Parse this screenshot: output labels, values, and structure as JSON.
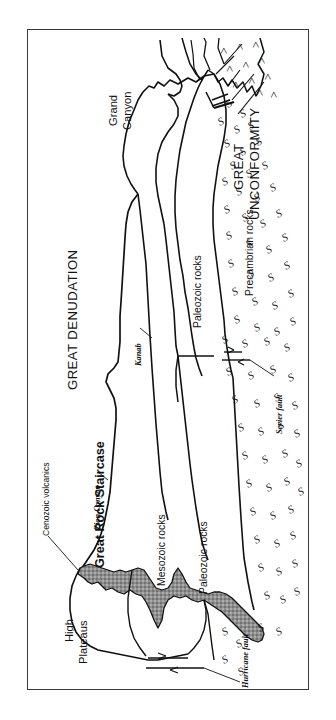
{
  "figure": {
    "type": "geologic-cross-section",
    "title_region_left": "GREAT DENUDATION",
    "title_region_right_line1": "GREAT",
    "title_region_right_line2": "UNCONFORMITY",
    "orientation_note": "diagram drawn rotated 90 degrees (reads bottom-to-top)",
    "frame_color": "#3a3a3a",
    "background_color": "#ffffff",
    "volcanic_fill_color": "#9a9a9a",
    "line_color": "#111111"
  },
  "headings": [
    {
      "id": "great-denudation",
      "text": "GREAT DENUDATION"
    },
    {
      "id": "great-unconformity-l1",
      "text": "GREAT"
    },
    {
      "id": "great-unconformity-l2",
      "text": "UNCONFORMITY"
    },
    {
      "id": "great-rock-staircase",
      "text": "Great Rock Staircase"
    }
  ],
  "place_labels": [
    {
      "id": "high-plateaus-l1",
      "text": "High"
    },
    {
      "id": "high-plateaus-l2",
      "text": "Plateaus"
    },
    {
      "id": "grand-canyon-l1",
      "text": "Grand"
    },
    {
      "id": "grand-canyon-l2",
      "text": "Canyon"
    }
  ],
  "unit_labels": [
    {
      "id": "cenozoic-volcanics",
      "text": "Cenozoic volcanics"
    },
    {
      "id": "mesozoic-rocks",
      "text": "Mesozoic rocks"
    },
    {
      "id": "paleozoic-rocks-west",
      "text": "Paleozoic rocks"
    },
    {
      "id": "paleozoic-rocks-east",
      "text": "Paleozoic rocks"
    },
    {
      "id": "precambrian-rocks",
      "text": "Precambrian rocks"
    }
  ],
  "feature_labels": [
    {
      "id": "zion-canyon",
      "text": "Zion Canyon"
    },
    {
      "id": "kanab",
      "text": "Kanab"
    },
    {
      "id": "hurricane-fault",
      "text": "Hurricane fault"
    },
    {
      "id": "sevier-fault",
      "text": "Sevier fault"
    }
  ],
  "patterns": {
    "precambrian_squiggle": "S",
    "tilted_strata_chevron": ">"
  }
}
